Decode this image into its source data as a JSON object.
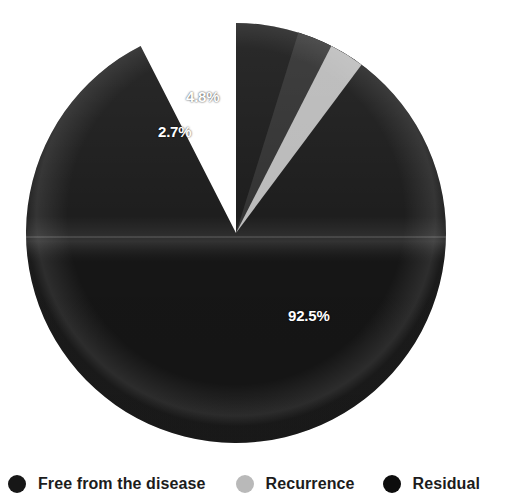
{
  "chart_data": {
    "type": "pie",
    "title": "",
    "subtitle": "",
    "xlabel": "",
    "ylabel": "",
    "grid": false,
    "legend_position": "bottom",
    "start_angle_deg": 90,
    "direction": "clockwise",
    "categories": [
      "Free from the disease",
      "Recurrence",
      "Residual"
    ],
    "values": [
      92.5,
      2.7,
      4.8
    ],
    "data_labels": [
      "92.5%",
      "2.7%",
      "4.8%"
    ],
    "colors": [
      "#171717",
      "#b9b9b9",
      "#2e2e2e"
    ],
    "slices": [
      {
        "name": "Free from the disease",
        "value": 92.5,
        "label": "92.5%",
        "color": "#171717",
        "start_deg": 90,
        "sweep_deg": 333.0
      },
      {
        "name": "Recurrence",
        "value": 2.7,
        "label": "2.7%",
        "color": "#b9b9b9",
        "start_deg": 63.0,
        "sweep_deg": 9.72
      },
      {
        "name": "Residual",
        "value": 4.8,
        "label": "4.8%",
        "color": "#2e2e2e",
        "start_deg": 72.72,
        "sweep_deg": 17.28
      }
    ]
  },
  "pie": {
    "center_x": 236,
    "center_y": 233,
    "radius": 210,
    "labels": {
      "free": "92.5%",
      "recurrence": "2.7%",
      "residual": "4.8%"
    }
  },
  "legend": {
    "items": [
      {
        "label": "Free from the disease",
        "color": "#171717"
      },
      {
        "label": "Recurrence",
        "color": "#b9b9b9"
      },
      {
        "label": "Residual",
        "color": "#0d0d0d"
      }
    ]
  }
}
